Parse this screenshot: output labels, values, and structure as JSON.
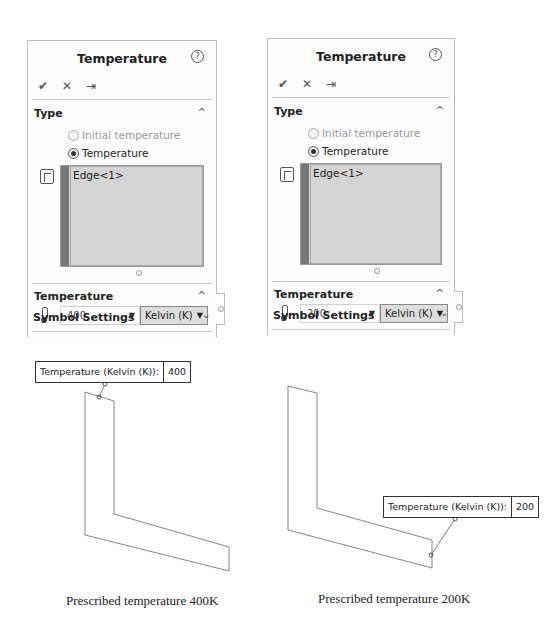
{
  "panels": [
    {
      "title": "Temperature",
      "help_icon": "question-circle-icon",
      "actions": {
        "ok": "✔",
        "cancel": "✕",
        "pin": "⇥"
      },
      "type_section": {
        "title": "Type",
        "options": [
          {
            "label": "Initial temperature",
            "selected": false,
            "enabled": false
          },
          {
            "label": "Temperature",
            "selected": true,
            "enabled": true
          }
        ],
        "selection_icon": "face-select-icon",
        "selected_entities": [
          "Edge<1>"
        ]
      },
      "temperature_section": {
        "title": "Temperature",
        "icon": "thermometer-icon",
        "value": "400",
        "unit": "Kelvin (K)"
      },
      "symbol_section": {
        "title": "Symbol Settings"
      }
    },
    {
      "title": "Temperature",
      "help_icon": "question-circle-icon",
      "actions": {
        "ok": "✔",
        "cancel": "✕",
        "pin": "⇥"
      },
      "type_section": {
        "title": "Type",
        "options": [
          {
            "label": "Initial temperature",
            "selected": false,
            "enabled": false
          },
          {
            "label": "Temperature",
            "selected": true,
            "enabled": true
          }
        ],
        "selection_icon": "face-select-icon",
        "selected_entities": [
          "Edge<1>"
        ]
      },
      "temperature_section": {
        "title": "Temperature",
        "icon": "thermometer-icon",
        "value": "200",
        "unit": "Kelvin (K)"
      },
      "symbol_section": {
        "title": "Symbol Settings"
      }
    }
  ],
  "callouts": [
    {
      "label": "Temperature (Kelvin (K)):",
      "value": "400"
    },
    {
      "label": "Temperature (Kelvin (K)):",
      "value": "200"
    }
  ],
  "captions": [
    "Prescribed temperature 400K",
    "Prescribed temperature 200K"
  ],
  "icons": {
    "chevron_up": "^",
    "chevron_down": "⌄",
    "dropdown_arrow": "▼",
    "help": "?"
  }
}
